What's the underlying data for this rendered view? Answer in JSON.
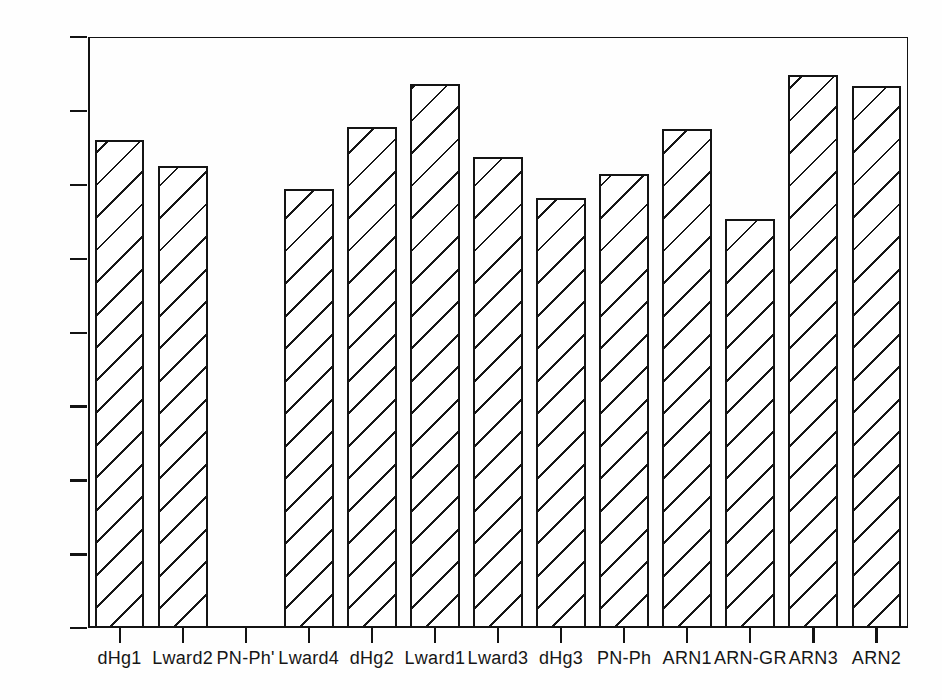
{
  "chart_data": {
    "type": "bar",
    "title": "",
    "subtitle": "",
    "xlabel": "",
    "ylabel": "",
    "categories": [
      "dHg1",
      "Lward2",
      "PN-Ph'",
      "Lward4",
      "dHg2",
      "Lward1",
      "Lward3",
      "dHg3",
      "PN-Ph",
      "ARN1",
      "ARN-GR",
      "ARN3",
      "ARN2"
    ],
    "values": [
      330,
      313,
      0,
      297,
      339,
      368,
      319,
      291,
      307,
      338,
      277,
      374,
      367
    ],
    "ylim": [
      0,
      400
    ],
    "ytick_labels": [
      "0",
      "50",
      "100",
      "150",
      "200",
      "250",
      "300",
      "350",
      "400"
    ],
    "ytick_values": [
      0,
      50,
      100,
      150,
      200,
      250,
      300,
      350,
      400
    ],
    "grid": false,
    "legend": null,
    "legend_position": "none",
    "bar_fill": "diagonal-hatch",
    "bar_edge_color": "#121212",
    "bar_face_color": "#ffffff",
    "axis_color": "#111111",
    "background_color": "#ffffff"
  }
}
